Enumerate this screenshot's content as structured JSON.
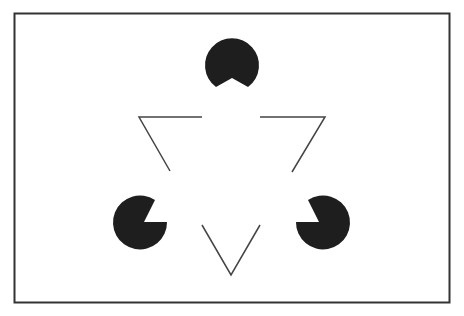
{
  "diagram": {
    "name": "Kanizsa triangle illusion",
    "colors": {
      "background": "#ffffff",
      "frame": "#333333",
      "fill": "#1e1e1e",
      "line": "#444444"
    },
    "frame": {
      "x": 14,
      "y": 13,
      "width": 435,
      "height": 289
    },
    "pacmen": [
      {
        "id": "top",
        "cx": 232,
        "cy": 65,
        "r": 27,
        "wedge_direction": "down"
      },
      {
        "id": "bottom-left",
        "cx": 140,
        "cy": 223,
        "r": 27,
        "wedge_direction": "up-right"
      },
      {
        "id": "bottom-right",
        "cx": 323,
        "cy": 223,
        "r": 27,
        "wedge_direction": "up-left"
      }
    ],
    "outline_segments": [
      {
        "id": "top-left-corner",
        "points": "202,117 139,117 170,171"
      },
      {
        "id": "top-right-corner",
        "points": "260,117 325,117 292,172"
      },
      {
        "id": "bottom-corner",
        "points": "202,225 231,275 260,225"
      }
    ]
  }
}
